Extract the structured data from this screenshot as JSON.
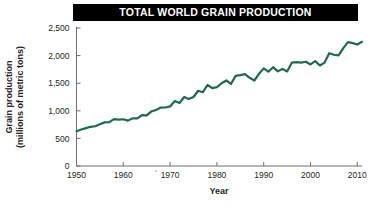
{
  "title": {
    "text": "TOTAL WORLD GRAIN PRODUCTION",
    "background": "#000000",
    "color": "#ffffff"
  },
  "axes": {
    "ylabel_line1": "Grain production",
    "ylabel_line2": "(millions of metric tons)",
    "xlabel": "Year",
    "artifact_mark": "˚"
  },
  "chart_data": {
    "type": "line",
    "title": "TOTAL WORLD GRAIN PRODUCTION",
    "xlabel": "Year",
    "ylabel": "Grain production (millions of metric tons)",
    "xlim": [
      1950,
      2011
    ],
    "ylim": [
      0,
      2500
    ],
    "grid": false,
    "legend": false,
    "line_color": "#1d6b4f",
    "line_width": 2.2,
    "xticks": [
      1950,
      1960,
      1970,
      1980,
      1990,
      2000,
      2010
    ],
    "xticklabels": [
      "1950",
      "1960",
      "1970",
      "1980",
      "1990",
      "2000",
      "2010"
    ],
    "yticks": [
      0,
      500,
      1000,
      1500,
      2000,
      2500
    ],
    "yticklabels": [
      "0",
      "500",
      "1,000",
      "1,500",
      "2,000",
      "2,500"
    ],
    "series": [
      {
        "name": "World grain production",
        "x": [
          1950,
          1951,
          1952,
          1953,
          1954,
          1955,
          1956,
          1957,
          1958,
          1959,
          1960,
          1961,
          1962,
          1963,
          1964,
          1965,
          1966,
          1967,
          1968,
          1969,
          1970,
          1971,
          1972,
          1973,
          1974,
          1975,
          1976,
          1977,
          1978,
          1979,
          1980,
          1981,
          1982,
          1983,
          1984,
          1985,
          1986,
          1987,
          1988,
          1989,
          1990,
          1991,
          1992,
          1993,
          1994,
          1995,
          1996,
          1997,
          1998,
          1999,
          2000,
          2001,
          2002,
          2003,
          2004,
          2005,
          2006,
          2007,
          2008,
          2009,
          2010,
          2011
        ],
        "y": [
          631,
          660,
          686,
          710,
          720,
          758,
          790,
          795,
          850,
          840,
          847,
          822,
          864,
          864,
          920,
          917,
          990,
          1015,
          1058,
          1060,
          1079,
          1177,
          1141,
          1250,
          1212,
          1250,
          1363,
          1337,
          1467,
          1411,
          1430,
          1499,
          1550,
          1486,
          1632,
          1647,
          1665,
          1598,
          1549,
          1671,
          1769,
          1708,
          1790,
          1714,
          1760,
          1713,
          1872,
          1881,
          1873,
          1889,
          1840,
          1899,
          1821,
          1873,
          2044,
          2015,
          2005,
          2134,
          2245,
          2225,
          2200,
          2250
        ]
      }
    ],
    "annotations": []
  }
}
